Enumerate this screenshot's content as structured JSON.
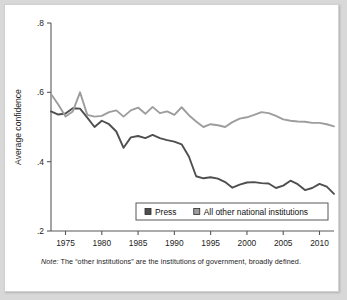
{
  "figure": {
    "note_prefix": "Note:",
    "note_text": " The “other institutions” are the institutions of government, broadly defined."
  },
  "chart_data": {
    "type": "line",
    "title": "",
    "xlabel": "",
    "ylabel": "Average confidence",
    "xlim": [
      1973,
      2012
    ],
    "ylim": [
      0.2,
      0.8
    ],
    "grid": false,
    "legend_position": "inside-bottom-right",
    "xticks": [
      1975,
      1980,
      1985,
      1990,
      1995,
      2000,
      2005,
      2010
    ],
    "xtick_labels": [
      "1975",
      "1980",
      "1985",
      "1990",
      "1995",
      "2000",
      "2005",
      "2010"
    ],
    "yticks": [
      0.2,
      0.4,
      0.6,
      0.8
    ],
    "ytick_labels": [
      ".2",
      ".4",
      ".6",
      ".8"
    ],
    "colors": {
      "press": "#4f4f51",
      "other": "#9d9d9f",
      "axis": "#58585a"
    },
    "x": [
      1973,
      1974,
      1975,
      1976,
      1977,
      1978,
      1979,
      1980,
      1981,
      1982,
      1983,
      1984,
      1985,
      1986,
      1987,
      1988,
      1989,
      1990,
      1991,
      1992,
      1993,
      1994,
      1995,
      1996,
      1997,
      1998,
      1999,
      2000,
      2001,
      2002,
      2003,
      2004,
      2005,
      2006,
      2007,
      2008,
      2009,
      2010,
      2011,
      2012
    ],
    "series": [
      {
        "name": "Press",
        "key": "press",
        "color": "#4f4f51",
        "values": [
          0.545,
          0.536,
          0.539,
          0.554,
          0.553,
          0.527,
          0.5,
          0.518,
          0.508,
          0.487,
          0.44,
          0.47,
          0.474,
          0.468,
          0.477,
          0.468,
          0.462,
          0.458,
          0.45,
          0.415,
          0.358,
          0.352,
          0.355,
          0.351,
          0.341,
          0.325,
          0.334,
          0.34,
          0.341,
          0.338,
          0.337,
          0.324,
          0.331,
          0.345,
          0.335,
          0.318,
          0.324,
          0.336,
          0.328,
          0.307
        ]
      },
      {
        "name": "All other national institutions",
        "key": "other",
        "color": "#9d9d9f",
        "values": [
          0.595,
          0.565,
          0.53,
          0.545,
          0.6,
          0.535,
          0.53,
          0.532,
          0.543,
          0.548,
          0.53,
          0.548,
          0.556,
          0.538,
          0.558,
          0.54,
          0.545,
          0.535,
          0.557,
          0.534,
          0.516,
          0.5,
          0.508,
          0.505,
          0.5,
          0.514,
          0.524,
          0.528,
          0.535,
          0.543,
          0.54,
          0.532,
          0.522,
          0.518,
          0.516,
          0.515,
          0.512,
          0.512,
          0.508,
          0.502
        ]
      }
    ],
    "legend": [
      {
        "label": "Press",
        "color": "#4f4f51"
      },
      {
        "label": "All other national institutions",
        "color": "#9d9d9f"
      }
    ]
  }
}
